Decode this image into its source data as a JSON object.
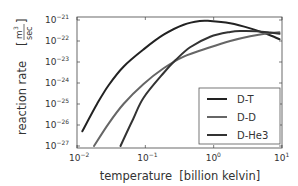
{
  "chart_data": {
    "type": "line",
    "title": "",
    "xlabel": "temperature  [billion kelvin]",
    "ylabel": "reaction rate",
    "ylabel_units": "m3/sec",
    "xscale": "log",
    "yscale": "log",
    "xlim": [
      0.01,
      12
    ],
    "ylim": [
      1e-27,
      1e-21
    ],
    "x_ticks": [
      "10^-2",
      "10^-1",
      "10^0",
      "10^1"
    ],
    "y_ticks": [
      "10^-27",
      "10^-26",
      "10^-25",
      "10^-24",
      "10^-23",
      "10^-22",
      "10^-21"
    ],
    "grid": false,
    "legend_position": "lower right",
    "series": [
      {
        "name": "D-T",
        "color": "#222222",
        "x": [
          0.012,
          0.02,
          0.03,
          0.05,
          0.1,
          0.2,
          0.4,
          0.7,
          1.0,
          2.0,
          4.0,
          7.0,
          11.0
        ],
        "y": [
          5e-27,
          1e-25,
          8e-25,
          6e-24,
          4e-23,
          2e-22,
          6e-22,
          9e-22,
          9e-22,
          7e-22,
          4e-22,
          2.2e-22,
          1.2e-22
        ]
      },
      {
        "name": "D-D",
        "color": "#666666",
        "x": [
          0.018,
          0.03,
          0.05,
          0.1,
          0.2,
          0.4,
          1.0,
          2.0,
          4.0,
          7.0,
          11.0
        ],
        "y": [
          1e-27,
          1.2e-26,
          1e-25,
          9e-25,
          5e-24,
          1.8e-23,
          5e-23,
          1e-22,
          1.7e-22,
          2.3e-22,
          2.6e-22
        ]
      },
      {
        "name": "D-He3",
        "color": "#333333",
        "x": [
          0.045,
          0.07,
          0.1,
          0.2,
          0.3,
          0.5,
          1.0,
          2.0,
          3.0,
          5.0,
          8.0,
          11.0
        ],
        "y": [
          1e-27,
          2e-26,
          2e-25,
          3e-24,
          1.2e-23,
          5e-23,
          1.6e-22,
          2.7e-22,
          3e-22,
          2.9e-22,
          2.5e-22,
          2.2e-22
        ]
      }
    ]
  },
  "axes": {
    "x_tick_labels": [
      {
        "base": "10",
        "exp": "−2"
      },
      {
        "base": "10",
        "exp": "−1"
      },
      {
        "base": "10",
        "exp": "0"
      },
      {
        "base": "10",
        "exp": "1"
      }
    ],
    "y_tick_labels": [
      {
        "base": "10",
        "exp": "−21"
      },
      {
        "base": "10",
        "exp": "−22"
      },
      {
        "base": "10",
        "exp": "−23"
      },
      {
        "base": "10",
        "exp": "−24"
      },
      {
        "base": "10",
        "exp": "−25"
      },
      {
        "base": "10",
        "exp": "−26"
      },
      {
        "base": "10",
        "exp": "−27"
      }
    ],
    "xlabel": "temperature  [billion kelvin]",
    "ylabel": "reaction rate",
    "yunit_num": "m",
    "yunit_num_exp": "3",
    "yunit_den": "sec"
  },
  "legend": {
    "items": [
      {
        "label": "D-T",
        "color": "#222222"
      },
      {
        "label": "D-D",
        "color": "#666666"
      },
      {
        "label": "D-He3",
        "color": "#333333"
      }
    ]
  }
}
